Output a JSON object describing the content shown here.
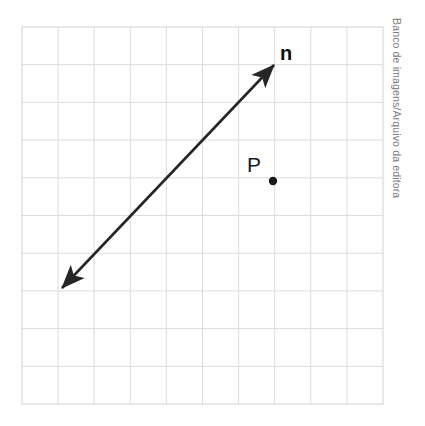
{
  "figure": {
    "background_color": "#ffffff",
    "credit": "Banco de imagens/Arquivo da editora",
    "credit_color": "#7d7d7d",
    "grid": {
      "columns": 10,
      "rows": 10,
      "left": 22,
      "top": 27,
      "right": 383,
      "bottom": 404,
      "cell_width": 36.1,
      "cell_height": 37.7,
      "line_color": "#dcdcdc",
      "border_color": "#d2d2d2",
      "line_width": 1
    },
    "line": {
      "name": "n",
      "label": "n",
      "label_x": 286,
      "label_y": 60,
      "color": "#262626",
      "stroke_width": 2.6,
      "double_headed": true,
      "start_x": 62,
      "start_y": 288,
      "end_x": 274,
      "end_y": 65,
      "arrowhead_length": 16,
      "arrowhead_width": 8
    },
    "point": {
      "name": "P",
      "label": "P",
      "x": 273,
      "y": 181,
      "radius": 4.2,
      "color": "#1a1a1a",
      "label_x": 254,
      "label_y": 172
    }
  }
}
